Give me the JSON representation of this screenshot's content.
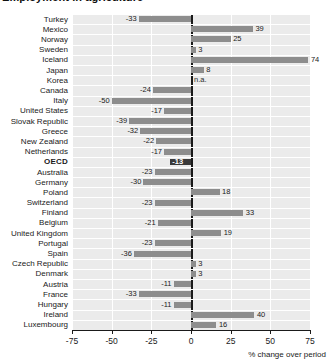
{
  "chart_data": {
    "type": "bar",
    "orientation": "horizontal",
    "title": "Employment in agriculture",
    "xlabel": "% change over period",
    "ylabel": "",
    "xlim": [
      -75,
      75
    ],
    "xticks": [
      -75,
      -50,
      -25,
      0,
      25,
      50,
      75
    ],
    "xticklabels": [
      "-75",
      "-50",
      "-25",
      "0",
      "25",
      "50",
      "75"
    ],
    "grid": true,
    "grid_axis": "x",
    "zero_line": true,
    "highlight_category": "OECD",
    "na_label": "n.a.",
    "categories": [
      "Turkey",
      "Mexico",
      "Norway",
      "Sweden",
      "Iceland",
      "Japan",
      "Korea",
      "Canada",
      "Italy",
      "United States",
      "Slovak Republic",
      "Greece",
      "New Zealand",
      "Netherlands",
      "OECD",
      "Australia",
      "Germany",
      "Poland",
      "Switzerland",
      "Finland",
      "Belgium",
      "United Kingdom",
      "Portugal",
      "Spain",
      "Czech Republic",
      "Denmark",
      "Austria",
      "France",
      "Hungary",
      "Ireland",
      "Luxembourg"
    ],
    "values": [
      -33,
      39,
      25,
      3,
      74,
      8,
      null,
      -24,
      -50,
      -17,
      -39,
      -32,
      -22,
      -17,
      -13,
      -23,
      -30,
      18,
      -23,
      33,
      -21,
      19,
      -23,
      -36,
      3,
      3,
      -11,
      -33,
      -11,
      40,
      16
    ],
    "value_labels": [
      "-33",
      "39",
      "25",
      "3",
      "74",
      "8",
      "n.a.",
      "-24",
      "-50",
      "-17",
      "-39",
      "-32",
      "-22",
      "-17",
      "-13",
      "-23",
      "-30",
      "18",
      "-23",
      "33",
      "-21",
      "19",
      "-23",
      "-36",
      "3",
      "3",
      "-11",
      "-33",
      "-11",
      "40",
      "16"
    ],
    "colors": {
      "bar": "#8d8d8d",
      "bar_highlight": "#3a3a3a",
      "plot_background": "#ebebeb",
      "gridline": "#ffffff",
      "axis": "#1a1a1a",
      "text": "#1a1a1a"
    }
  }
}
